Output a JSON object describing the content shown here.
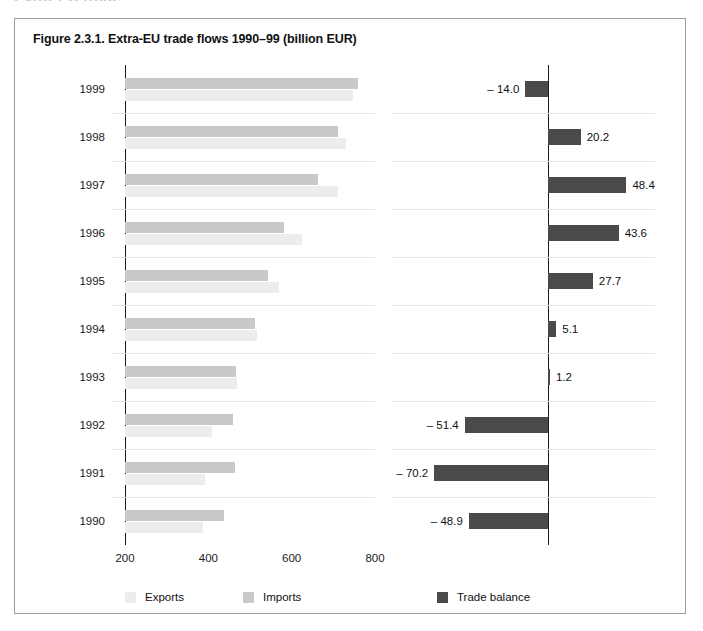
{
  "page": {
    "cut_heading": "Extra-EU trade"
  },
  "figure": {
    "title": "Figure 2.3.1. Extra-EU trade flows 1990–99 (billion EUR)"
  },
  "legend": {
    "exports": "Exports",
    "imports": "Imports",
    "balance": "Trade balance"
  },
  "colors": {
    "exports": "#ededed",
    "imports": "#c9c9c9",
    "balance": "#4a4a4a",
    "axis": "#1a1a1a",
    "gridline": "#e7e7e7",
    "border": "#9b9b9b"
  },
  "chart_data": {
    "type": "bar",
    "title": "Figure 2.3.1. Extra-EU trade flows 1990–99 (billion EUR)",
    "orientation": "horizontal",
    "xlabel": "",
    "ylabel": "",
    "grid": true,
    "legend_position": "bottom",
    "categories": [
      "1999",
      "1998",
      "1997",
      "1996",
      "1995",
      "1994",
      "1993",
      "1992",
      "1991",
      "1990"
    ],
    "panels": [
      {
        "name": "trade-flows",
        "xlim": [
          200,
          800
        ],
        "xticks": [
          200,
          400,
          600,
          800
        ],
        "xtick_labels": [
          "200",
          "400",
          "600",
          "800"
        ],
        "series": [
          {
            "name": "Imports",
            "color": "#c9c9c9",
            "values": [
              760.0,
              710.0,
              662.0,
              581.0,
              542.0,
              512.0,
              467.0,
              460.0,
              463.0,
              437.0
            ]
          },
          {
            "name": "Exports",
            "color": "#ededed",
            "values": [
              746.0,
              730.2,
              710.4,
              624.6,
              569.7,
              517.1,
              468.2,
              408.6,
              392.8,
              388.1
            ]
          }
        ]
      },
      {
        "name": "trade-balance",
        "xlim": [
          -80,
          60
        ],
        "series": [
          {
            "name": "Trade balance",
            "color": "#4a4a4a",
            "values": [
              -14.0,
              20.2,
              48.4,
              43.6,
              27.7,
              5.1,
              1.2,
              -51.4,
              -70.2,
              -48.9
            ],
            "labels": [
              "– 14.0",
              "20.2",
              "48.4",
              "43.6",
              "27.7",
              "5.1",
              "1.2",
              "– 51.4",
              "– 70.2",
              "– 48.9"
            ]
          }
        ]
      }
    ]
  }
}
